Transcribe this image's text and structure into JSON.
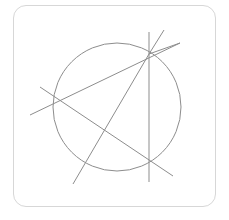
{
  "figure": {
    "card": {
      "x": 13,
      "y": 5,
      "width": 203,
      "height": 202,
      "corner_radius": 13,
      "border_color": "#d7d7d7",
      "background_color": "#ffffff"
    },
    "stroke_color": "#8d8d8d",
    "stroke_width": 1,
    "circle": {
      "label": "main-circle",
      "cx": 117,
      "cy": 107,
      "r": 64
    },
    "points": [
      {
        "label": "point-top-right",
        "x": 149,
        "y": 54
      },
      {
        "label": "point-left",
        "x": 56,
        "y": 100
      },
      {
        "label": "point-bottom-right",
        "x": 149,
        "y": 158
      },
      {
        "label": "chord-crossing",
        "x": 104,
        "y": 132
      }
    ],
    "lines": [
      {
        "label": "vertical-line",
        "x1": 149,
        "y1": 32,
        "x2": 149,
        "y2": 182
      },
      {
        "label": "line-upper-right-steep",
        "x1": 149,
        "y1": 54,
        "x2": 164,
        "y2": 30
      },
      {
        "label": "line-upper-right-shallow",
        "x1": 149,
        "y1": 54,
        "x2": 180,
        "y2": 43
      },
      {
        "label": "line-topright-to-left",
        "x1": 180,
        "y1": 43,
        "x2": 30,
        "y2": 115
      },
      {
        "label": "line-topright-to-bottomleft",
        "x1": 149,
        "y1": 54,
        "x2": 73,
        "y2": 184
      },
      {
        "label": "line-left-to-bottomright",
        "x1": 40,
        "y1": 87,
        "x2": 173,
        "y2": 176
      }
    ]
  }
}
